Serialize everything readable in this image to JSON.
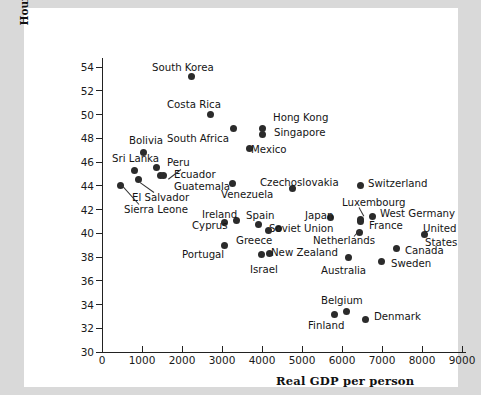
{
  "figure": {
    "background": "#ffffff",
    "page_background": "#d9d9d9",
    "marker_color": "#2b2b2b"
  },
  "chart_data": {
    "type": "scatter",
    "title": "",
    "xlabel": "Real GDP per person",
    "ylabel": "Hours of work per week",
    "xlim": [
      0,
      9600
    ],
    "ylim": [
      30,
      55
    ],
    "xticks": [
      0,
      1000,
      2000,
      3000,
      4000,
      5000,
      6000,
      7000,
      8000,
      9000
    ],
    "yticks": [
      30,
      32,
      34,
      36,
      38,
      40,
      42,
      44,
      46,
      48,
      50,
      52,
      54
    ],
    "grid": false,
    "legend": "none",
    "points": [
      {
        "label": "South Korea",
        "x": 2230,
        "y": 53.2,
        "lx": 128,
        "ly": 55,
        "leader": false
      },
      {
        "label": "Costa Rica",
        "x": 2700,
        "y": 50.0,
        "lx": 143,
        "ly": 92,
        "leader": false
      },
      {
        "label": "South Africa",
        "x": 3280,
        "y": 48.8,
        "lx": 143,
        "ly": 126,
        "leader": false
      },
      {
        "label": "Bolivia",
        "x": 1030,
        "y": 46.8,
        "lx": 105,
        "ly": 128,
        "leader": false
      },
      {
        "label": "Mexico",
        "x": 3680,
        "y": 47.1,
        "lx": 227,
        "ly": 137,
        "leader": false
      },
      {
        "label": "Sri Lanka",
        "x": 800,
        "y": 45.3,
        "lx": 88,
        "ly": 146,
        "leader": false
      },
      {
        "label": "Peru",
        "x": 1370,
        "y": 45.5,
        "lx": 143,
        "ly": 150,
        "leader": false
      },
      {
        "label": "Ecuador",
        "x": 1450,
        "y": 44.9,
        "lx": 150,
        "ly": 162,
        "leader": true,
        "a1x": 157,
        "a1y": 161,
        "a2x": 144,
        "a2y": 171
      },
      {
        "label": "Guatemala",
        "x": 1530,
        "y": 44.9,
        "lx": 150,
        "ly": 174,
        "leader": false
      },
      {
        "label": "El Salvador",
        "x": 900,
        "y": 44.5,
        "lx": 108,
        "ly": 185,
        "leader": true,
        "a1x": 130,
        "a1y": 184,
        "a2x": 116,
        "a2y": 174
      },
      {
        "label": "Sierra Leone",
        "x": 460,
        "y": 44.0,
        "lx": 100,
        "ly": 197,
        "leader": true,
        "a1x": 115,
        "a1y": 196,
        "a2x": 98,
        "a2y": 177
      },
      {
        "label": "Venezuela",
        "x": 3260,
        "y": 44.2,
        "lx": 197,
        "ly": 182,
        "leader": false
      },
      {
        "label": "Czechoslovakia",
        "x": 4750,
        "y": 43.8,
        "lx": 236,
        "ly": 170,
        "leader": false
      },
      {
        "label": "Hong Kong",
        "x": 4000,
        "y": 48.8,
        "lx": 249,
        "ly": 105,
        "leader": false
      },
      {
        "label": "Singapore",
        "x": 4000,
        "y": 48.3,
        "lx": 250,
        "ly": 120,
        "leader": false
      },
      {
        "label": "Switzerland",
        "x": 6450,
        "y": 44.0,
        "lx": 344,
        "ly": 171,
        "leader": false
      },
      {
        "label": "Luxembourg",
        "x": 6460,
        "y": 41.2,
        "lx": 318,
        "ly": 190,
        "leader": true,
        "a1x": 335,
        "a1y": 199,
        "a2x": 340,
        "a2y": 208
      },
      {
        "label": "West Germany",
        "x": 6760,
        "y": 41.4,
        "lx": 356,
        "ly": 201,
        "leader": false
      },
      {
        "label": "Japan",
        "x": 5700,
        "y": 41.3,
        "lx": 281,
        "ly": 203,
        "leader": false
      },
      {
        "label": "France",
        "x": 6460,
        "y": 41.0,
        "lx": 345,
        "ly": 213,
        "leader": false
      },
      {
        "label": "Ireland",
        "x": 3350,
        "y": 41.1,
        "lx": 178,
        "ly": 202,
        "leader": false
      },
      {
        "label": "Spain",
        "x": 3900,
        "y": 40.7,
        "lx": 222,
        "ly": 203,
        "leader": false
      },
      {
        "label": "Cyprus",
        "x": 3060,
        "y": 40.9,
        "lx": 168,
        "ly": 213,
        "leader": false
      },
      {
        "label": "Soviet Union",
        "x": 4420,
        "y": 40.4,
        "lx": 245,
        "ly": 216,
        "leader": false
      },
      {
        "label": "Greece",
        "x": 4170,
        "y": 40.2,
        "lx": 212,
        "ly": 228,
        "leader": false
      },
      {
        "label": "Netherlands",
        "x": 6440,
        "y": 40.1,
        "lx": 289,
        "ly": 228,
        "leader": true,
        "a1x": 330,
        "a1y": 228,
        "a2x": 336,
        "a2y": 221
      },
      {
        "label": "United",
        "x": 8060,
        "y": 39.9,
        "lx": 399,
        "ly": 216,
        "leader": false
      },
      {
        "label": "States",
        "x": null,
        "y": null,
        "lx": 401,
        "ly": 230,
        "leader": false
      },
      {
        "label": "New Zealand",
        "x": 4180,
        "y": 38.3,
        "lx": 247,
        "ly": 240,
        "leader": false
      },
      {
        "label": "Portugal",
        "x": 3070,
        "y": 39.0,
        "lx": 158,
        "ly": 242,
        "leader": false
      },
      {
        "label": "Israel",
        "x": 3980,
        "y": 38.2,
        "lx": 226,
        "ly": 257,
        "leader": false
      },
      {
        "label": "Australia",
        "x": 6150,
        "y": 38.0,
        "lx": 297,
        "ly": 258,
        "leader": false
      },
      {
        "label": "Canada",
        "x": 7350,
        "y": 38.7,
        "lx": 381,
        "ly": 238,
        "leader": false
      },
      {
        "label": "Sweden",
        "x": 6980,
        "y": 37.6,
        "lx": 367,
        "ly": 251,
        "leader": false
      },
      {
        "label": "Belgium",
        "x": 6100,
        "y": 33.4,
        "lx": 297,
        "ly": 288,
        "leader": false
      },
      {
        "label": "Finland",
        "x": 5800,
        "y": 33.2,
        "lx": 284,
        "ly": 313,
        "leader": false
      },
      {
        "label": "Denmark",
        "x": 6580,
        "y": 32.7,
        "lx": 350,
        "ly": 304,
        "leader": false
      }
    ]
  }
}
